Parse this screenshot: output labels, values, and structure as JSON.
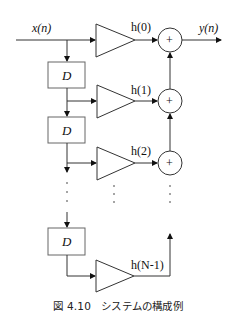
{
  "labels": {
    "input": "x(n)",
    "output": "y(n)",
    "delay": "D",
    "sum": "+",
    "coef0": "h(0)",
    "coef1": "h(1)",
    "coef2": "h(2)",
    "coefLast": "h(N-1)"
  },
  "caption": "図 4.10　システムの構成例",
  "colors": {
    "stroke": "#333333",
    "delayBorder": "#555555",
    "text": "#111111"
  }
}
